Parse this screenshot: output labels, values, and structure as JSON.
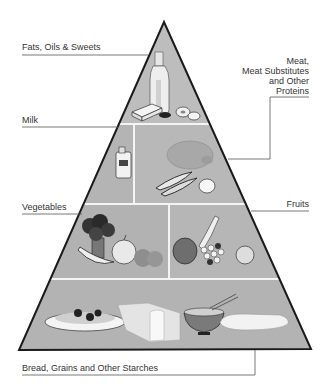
{
  "diagram": {
    "type": "food-pyramid",
    "colors": {
      "fill": "#b8b8b8",
      "outline": "#1a1a1a",
      "divider": "#f2f2f2",
      "leader_line": "#666666",
      "background": "#ffffff"
    },
    "tiers": [
      {
        "id": "fats",
        "label": "Fats, Oils & Sweets",
        "foods": [
          "oil-bottle",
          "butter",
          "cookies",
          "donut"
        ]
      },
      {
        "id": "milk-meat",
        "sections": [
          {
            "id": "milk",
            "label": "Milk",
            "foods": [
              "milk-jug"
            ]
          },
          {
            "id": "meat",
            "label_lines": [
              "Meat,",
              "Meat Substitutes",
              "and Other",
              "Proteins"
            ],
            "foods": [
              "chicken",
              "fish",
              "egg"
            ]
          }
        ]
      },
      {
        "id": "veg-fruit",
        "sections": [
          {
            "id": "vegetables",
            "label": "Vegetables",
            "foods": [
              "broccoli",
              "onion",
              "pea-pod",
              "tomatoes"
            ]
          },
          {
            "id": "fruits",
            "label": "Fruits",
            "foods": [
              "apple",
              "banana",
              "grapes",
              "orange"
            ]
          }
        ]
      },
      {
        "id": "starches",
        "label": "Bread, Grains and Other Starches",
        "foods": [
          "pasta-plate",
          "bread-loaf",
          "rice-bowl",
          "baguette"
        ]
      }
    ]
  }
}
